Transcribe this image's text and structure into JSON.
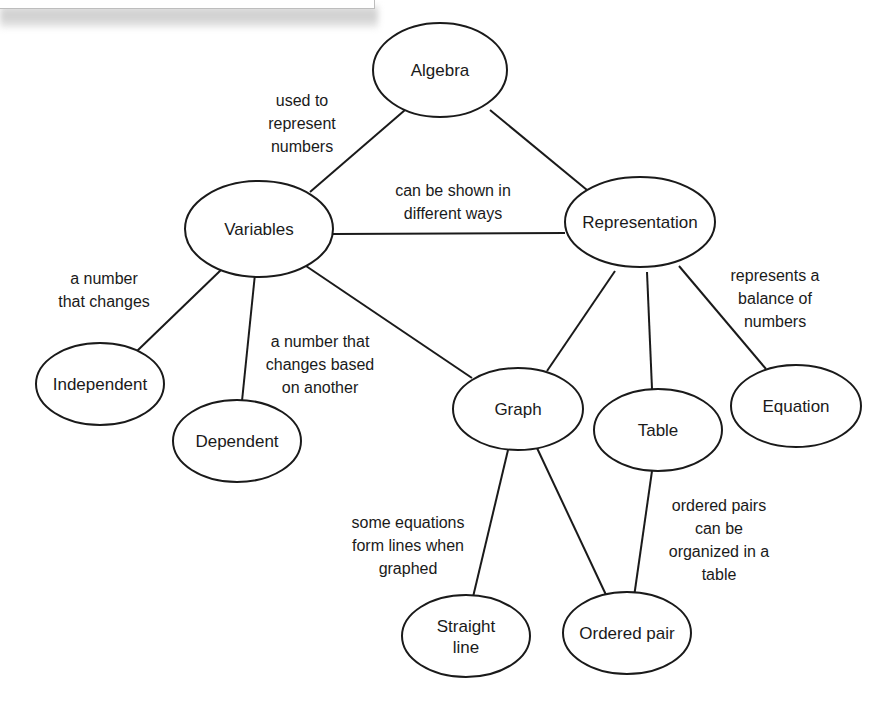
{
  "diagram": {
    "type": "concept-map",
    "colors": {
      "stroke": "#1a1a1a",
      "fill": "#ffffff",
      "background": "#ffffff"
    },
    "nodes": [
      {
        "id": "algebra",
        "label_lines": [
          "Algebra"
        ],
        "cx": 440,
        "cy": 70,
        "rx": 67,
        "ry": 47
      },
      {
        "id": "variables",
        "label_lines": [
          "Variables"
        ],
        "cx": 259,
        "cy": 229,
        "rx": 74,
        "ry": 48
      },
      {
        "id": "representation",
        "label_lines": [
          "Representation"
        ],
        "cx": 640,
        "cy": 222,
        "rx": 75,
        "ry": 45
      },
      {
        "id": "independent",
        "label_lines": [
          "Independent"
        ],
        "cx": 100,
        "cy": 384,
        "rx": 64,
        "ry": 41
      },
      {
        "id": "dependent",
        "label_lines": [
          "Dependent"
        ],
        "cx": 237,
        "cy": 441,
        "rx": 64,
        "ry": 41
      },
      {
        "id": "graph",
        "label_lines": [
          "Graph"
        ],
        "cx": 518,
        "cy": 409,
        "rx": 65,
        "ry": 41
      },
      {
        "id": "table",
        "label_lines": [
          "Table"
        ],
        "cx": 658,
        "cy": 430,
        "rx": 64,
        "ry": 41
      },
      {
        "id": "equation",
        "label_lines": [
          "Equation"
        ],
        "cx": 796,
        "cy": 406,
        "rx": 65,
        "ry": 41
      },
      {
        "id": "straight-line",
        "label_lines": [
          "Straight",
          "line"
        ],
        "cx": 466,
        "cy": 636,
        "rx": 64,
        "ry": 41
      },
      {
        "id": "ordered-pair",
        "label_lines": [
          "Ordered pair"
        ],
        "cx": 627,
        "cy": 633,
        "rx": 64,
        "ry": 41
      }
    ],
    "edges": [
      {
        "from": "algebra",
        "to": "variables",
        "x1": 405,
        "y1": 110,
        "x2": 310,
        "y2": 192
      },
      {
        "from": "algebra",
        "to": "representation",
        "x1": 490,
        "y1": 110,
        "x2": 587,
        "y2": 190
      },
      {
        "from": "variables",
        "to": "representation",
        "x1": 333,
        "y1": 234,
        "x2": 565,
        "y2": 233
      },
      {
        "from": "variables",
        "to": "independent",
        "x1": 222,
        "y1": 269,
        "x2": 137,
        "y2": 351
      },
      {
        "from": "variables",
        "to": "dependent",
        "x1": 255,
        "y1": 274,
        "x2": 242,
        "y2": 401
      },
      {
        "from": "variables",
        "to": "graph",
        "x1": 306,
        "y1": 266,
        "x2": 472,
        "y2": 378
      },
      {
        "from": "representation",
        "to": "graph",
        "x1": 615,
        "y1": 271,
        "x2": 547,
        "y2": 371
      },
      {
        "from": "representation",
        "to": "table",
        "x1": 647,
        "y1": 272,
        "x2": 652,
        "y2": 389
      },
      {
        "from": "representation",
        "to": "equation",
        "x1": 679,
        "y1": 266,
        "x2": 766,
        "y2": 369
      },
      {
        "from": "graph",
        "to": "straight-line",
        "x1": 508,
        "y1": 450,
        "x2": 473,
        "y2": 597
      },
      {
        "from": "graph",
        "to": "ordered-pair",
        "x1": 537,
        "y1": 448,
        "x2": 607,
        "y2": 597
      },
      {
        "from": "table",
        "to": "ordered-pair",
        "x1": 652,
        "y1": 471,
        "x2": 634,
        "y2": 597
      }
    ],
    "link_labels": [
      {
        "id": "used-to-represent-numbers",
        "lines": [
          "used to",
          "represent",
          "numbers"
        ],
        "x": 302,
        "y": 106
      },
      {
        "id": "can-be-shown-in-different-ways",
        "lines": [
          "can be shown in",
          "different ways"
        ],
        "x": 453,
        "y": 196
      },
      {
        "id": "a-number-that-changes",
        "lines": [
          "a number",
          "that changes"
        ],
        "x": 104,
        "y": 284
      },
      {
        "id": "a-number-that-changes-based-on-another",
        "lines": [
          "a number that",
          "changes based",
          "on another"
        ],
        "x": 320,
        "y": 347
      },
      {
        "id": "represents-a-balance-of-numbers",
        "lines": [
          "represents a",
          "balance of",
          "numbers"
        ],
        "x": 775,
        "y": 281
      },
      {
        "id": "some-equations-form-lines-when-graphed",
        "lines": [
          "some equations",
          "form lines when",
          "graphed"
        ],
        "x": 408,
        "y": 528
      },
      {
        "id": "ordered-pairs-can-be-organized-in-a-table",
        "lines": [
          "ordered pairs",
          "can be",
          "organized in a",
          "table"
        ],
        "x": 719,
        "y": 511
      }
    ]
  }
}
